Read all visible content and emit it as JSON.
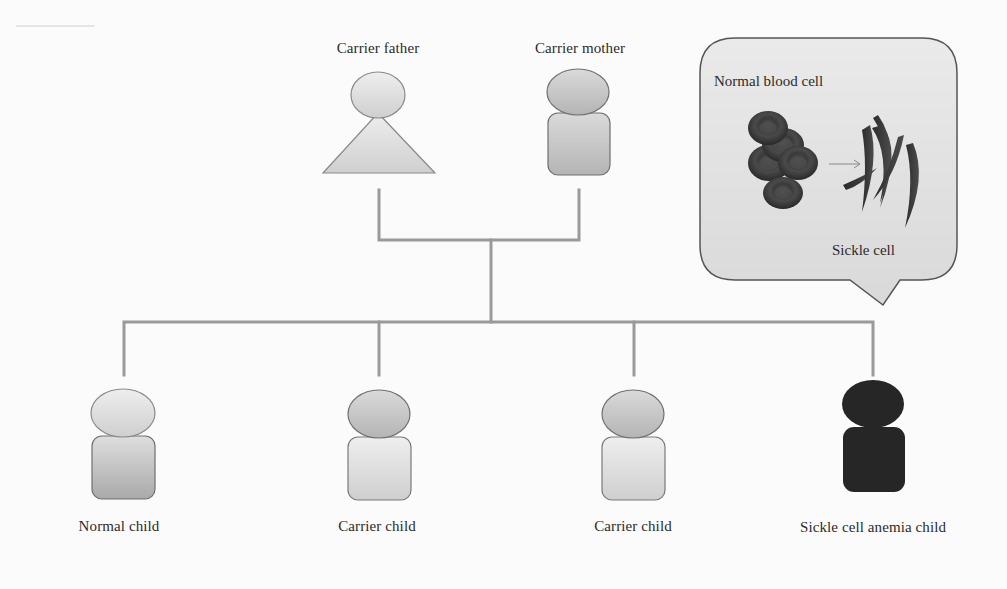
{
  "figure": {
    "type": "pedigree",
    "colors": {
      "line": "#9a9a9a",
      "figure_light_fill": "#dcdcdc",
      "figure_medium_fill": "#c4c4c4",
      "figure_dark_fill": "#262626",
      "figure_outline": "#6f6f6f",
      "bubble_fill": "#e3e3e3",
      "bubble_outline": "#555555",
      "cell_color": "#3a3a3a"
    },
    "parents": [
      {
        "id": "father",
        "label": "Carrier father",
        "shape": "triangle-body",
        "status": "carrier"
      },
      {
        "id": "mother",
        "label": "Carrier mother",
        "shape": "rounded-body",
        "status": "carrier"
      }
    ],
    "children": [
      {
        "id": "child1",
        "label": "Normal child",
        "status": "normal"
      },
      {
        "id": "child2",
        "label": "Carrier child",
        "status": "carrier"
      },
      {
        "id": "child3",
        "label": "Carrier child",
        "status": "carrier"
      },
      {
        "id": "child4",
        "label": "Sickle cell anemia child",
        "status": "affected"
      }
    ],
    "callout": {
      "normal_label": "Normal blood cell",
      "sickle_label": "Sickle cell",
      "arrow": "right-arrow"
    }
  }
}
